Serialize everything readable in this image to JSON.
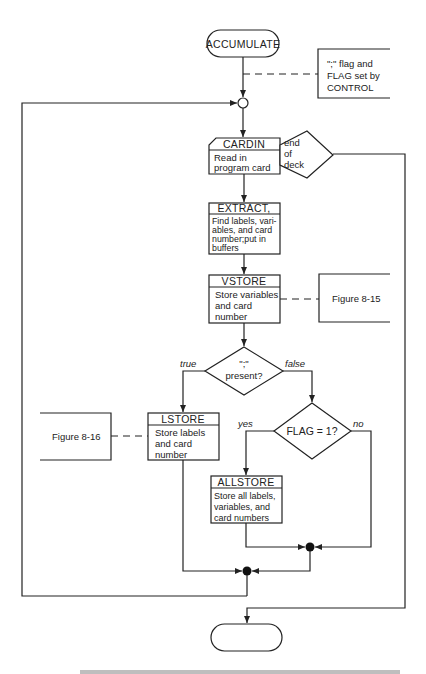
{
  "diagram": {
    "type": "flowchart",
    "start_terminator": {
      "label": "ACCUMULATE"
    },
    "end_terminator": {
      "label": ""
    },
    "annotations": {
      "control_note": {
        "lines": [
          "\";\" flag and",
          "FLAG set by",
          "CONTROL"
        ]
      },
      "figure_8_15": {
        "label": "Figure 8-15"
      },
      "figure_8_16": {
        "label": "Figure 8-16"
      }
    },
    "nodes": {
      "cardin": {
        "title": "CARDIN",
        "lines": [
          "Read in",
          "program card"
        ]
      },
      "end_of_deck": {
        "lines": [
          "end",
          "of",
          "deck"
        ]
      },
      "extract": {
        "title": "EXTRACT,",
        "lines": [
          "Find labels, vari-",
          "ables, and card",
          "number;put in",
          "buffers"
        ]
      },
      "vstore": {
        "title": "VSTORE",
        "lines": [
          "Store variables",
          "and card",
          "number"
        ]
      },
      "semicolon_decision": {
        "lines": [
          "\";\"",
          "present?"
        ],
        "true_label": "true",
        "false_label": "false"
      },
      "lstore": {
        "title": "LSTORE",
        "lines": [
          "Store labels",
          "and card",
          "number"
        ]
      },
      "flag_decision": {
        "label": "FLAG = 1?",
        "yes_label": "yes",
        "no_label": "no"
      },
      "allstore": {
        "title": "ALLSTORE",
        "lines": [
          "Store all labels,",
          "variables, and",
          "card numbers"
        ]
      }
    },
    "caption_partial": "ACCUMULATE — ... flowchart of the ACTION algorithm (caption cut off)"
  },
  "colors": {
    "line": "#222222",
    "background": "#ffffff"
  }
}
